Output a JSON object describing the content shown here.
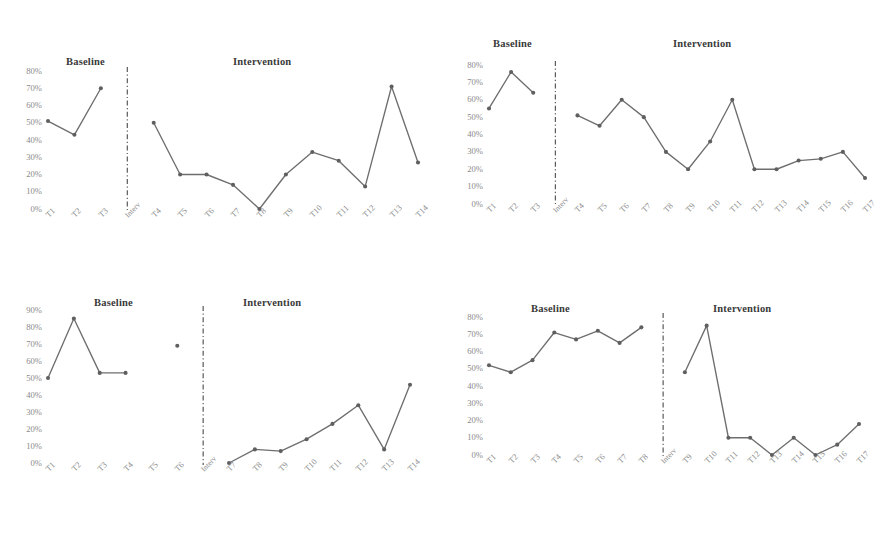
{
  "figure": {
    "background_color": "#ffffff",
    "line_color": "#6e6e6e",
    "marker_color": "#5f5f5f",
    "divider_color": "#4a4a4a",
    "tick_color": "#8a8a8a",
    "header_color": "#3a3a3a",
    "phase_labels": {
      "baseline": "Baseline",
      "intervention": "Intervention"
    },
    "divider_tick_label": "Interv"
  },
  "chart_data": [
    {
      "id": "participant-1",
      "type": "line",
      "title": "",
      "xlabel": "",
      "ylabel": "",
      "ylim": [
        0,
        80
      ],
      "ytick_labels": [
        "80%",
        "70%",
        "60%",
        "50%",
        "40%",
        "30%",
        "20%",
        "10%",
        "0%"
      ],
      "ytick_values": [
        80,
        70,
        60,
        50,
        40,
        30,
        20,
        10,
        0
      ],
      "grid": false,
      "legend": "none",
      "phase_headers": [
        "Baseline",
        "Intervention"
      ],
      "divider_label": "Interv",
      "categories": [
        "T1",
        "T2",
        "T3",
        "Interv",
        "T4",
        "T5",
        "T6",
        "T7",
        "T8",
        "T9",
        "T10",
        "T11",
        "T12",
        "T13",
        "T14"
      ],
      "series": [
        {
          "name": "Baseline",
          "x": [
            "T1",
            "T2",
            "T3"
          ],
          "values": [
            51,
            43,
            70
          ]
        },
        {
          "name": "Intervention",
          "x": [
            "T4",
            "T5",
            "T6",
            "T7",
            "T8",
            "T9",
            "T10",
            "T11",
            "T12",
            "T13",
            "T14"
          ],
          "values": [
            50,
            20,
            20,
            14,
            0,
            20,
            33,
            28,
            13,
            71,
            27
          ]
        }
      ]
    },
    {
      "id": "participant-2",
      "type": "line",
      "title": "",
      "xlabel": "",
      "ylabel": "",
      "ylim": [
        0,
        80
      ],
      "ytick_labels": [
        "80%",
        "70%",
        "60%",
        "50%",
        "40%",
        "30%",
        "20%",
        "10%",
        "0%"
      ],
      "ytick_values": [
        80,
        70,
        60,
        50,
        40,
        30,
        20,
        10,
        0
      ],
      "grid": false,
      "legend": "none",
      "phase_headers": [
        "Baseline",
        "Intervention"
      ],
      "divider_label": "Interv",
      "categories": [
        "T1",
        "T2",
        "T3",
        "Interv",
        "T4",
        "T5",
        "T6",
        "T7",
        "T8",
        "T9",
        "T10",
        "T11",
        "T12",
        "T13",
        "T14",
        "T15",
        "T16",
        "T17"
      ],
      "series": [
        {
          "name": "Baseline",
          "x": [
            "T1",
            "T2",
            "T3"
          ],
          "values": [
            55,
            76,
            64
          ]
        },
        {
          "name": "Intervention",
          "x": [
            "T4",
            "T5",
            "T6",
            "T7",
            "T8",
            "T9",
            "T10",
            "T11",
            "T12",
            "T13",
            "T14",
            "T15",
            "T16",
            "T17"
          ],
          "values": [
            51,
            45,
            60,
            50,
            30,
            20,
            36,
            60,
            20,
            20,
            25,
            26,
            30,
            15
          ]
        }
      ]
    },
    {
      "id": "participant-3",
      "type": "line",
      "title": "",
      "xlabel": "",
      "ylabel": "",
      "ylim": [
        0,
        90
      ],
      "ytick_labels": [
        "90%",
        "80%",
        "70%",
        "60%",
        "50%",
        "40%",
        "30%",
        "20%",
        "10%",
        "0%"
      ],
      "ytick_values": [
        90,
        80,
        70,
        60,
        50,
        40,
        30,
        20,
        10,
        0
      ],
      "grid": false,
      "legend": "none",
      "phase_headers": [
        "Baseline",
        "Intervention"
      ],
      "divider_label": "Interv",
      "categories": [
        "T1",
        "T2",
        "T3",
        "T4",
        "T5",
        "T6",
        "Interv",
        "T7",
        "T8",
        "T9",
        "T10",
        "T11",
        "T12",
        "T13",
        "T14"
      ],
      "series": [
        {
          "name": "Baseline",
          "x": [
            "T1",
            "T2",
            "T3",
            "T4"
          ],
          "values": [
            50,
            85,
            53,
            53
          ]
        },
        {
          "name": "Baseline isolated point",
          "x": [
            "T6"
          ],
          "values": [
            69
          ]
        },
        {
          "name": "Intervention",
          "x": [
            "T7",
            "T8",
            "T9",
            "T10",
            "T11",
            "T12",
            "T13",
            "T14"
          ],
          "values": [
            0,
            8,
            7,
            14,
            23,
            34,
            8,
            46
          ]
        }
      ]
    },
    {
      "id": "participant-4",
      "type": "line",
      "title": "",
      "xlabel": "",
      "ylabel": "",
      "ylim": [
        0,
        80
      ],
      "ytick_labels": [
        "80%",
        "70%",
        "60%",
        "50%",
        "40%",
        "30%",
        "20%",
        "10%",
        "0%"
      ],
      "ytick_values": [
        80,
        70,
        60,
        50,
        40,
        30,
        20,
        10,
        0
      ],
      "grid": false,
      "legend": "none",
      "phase_headers": [
        "Baseline",
        "Intervention"
      ],
      "divider_label": "Interv",
      "categories": [
        "T1",
        "T2",
        "T3",
        "T4",
        "T5",
        "T6",
        "T7",
        "T8",
        "Interv",
        "T9",
        "T10",
        "T11",
        "T12",
        "T13",
        "T14",
        "T15",
        "T16",
        "T17"
      ],
      "series": [
        {
          "name": "Baseline",
          "x": [
            "T1",
            "T2",
            "T3",
            "T4",
            "T5",
            "T6",
            "T7",
            "T8"
          ],
          "values": [
            52,
            48,
            55,
            71,
            67,
            72,
            65,
            74
          ]
        },
        {
          "name": "Intervention",
          "x": [
            "T9",
            "T10",
            "T11",
            "T12",
            "T13",
            "T14",
            "T15",
            "T16",
            "T17"
          ],
          "values": [
            48,
            75,
            10,
            10,
            0,
            10,
            0,
            6,
            18
          ]
        }
      ]
    }
  ]
}
